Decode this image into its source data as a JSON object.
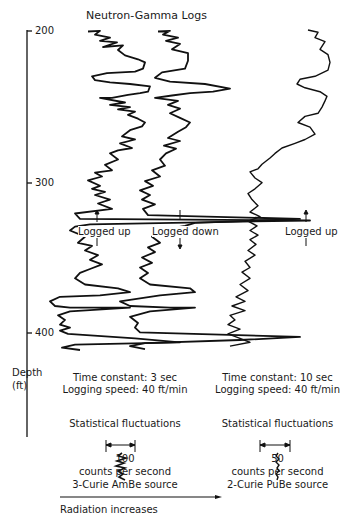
{
  "chart_data": {
    "type": "line",
    "title": "Neutron-Gamma Logs",
    "xlabel": "Radiation increases",
    "ylabel": "Depth (ft)",
    "ylim": [
      200,
      425
    ],
    "y_ticks": [
      200,
      300,
      400
    ],
    "grid": false,
    "series": [
      {
        "name": "Logged up (3 sec, AmBe)",
        "direction": "up",
        "points": [
          [
            88,
            32
          ],
          [
            100,
            31
          ],
          [
            95,
            36
          ],
          [
            110,
            40
          ],
          [
            100,
            44
          ],
          [
            117,
            46
          ],
          [
            103,
            52
          ],
          [
            123,
            50
          ],
          [
            118,
            56
          ],
          [
            125,
            63
          ],
          [
            138,
            68
          ],
          [
            145,
            72
          ],
          [
            143,
            80
          ],
          [
            135,
            84
          ],
          [
            107,
            86
          ],
          [
            92,
            90
          ],
          [
            95,
            95
          ],
          [
            110,
            98
          ],
          [
            130,
            100
          ],
          [
            150,
            103
          ],
          [
            148,
            110
          ],
          [
            140,
            112
          ],
          [
            128,
            114
          ],
          [
            112,
            118
          ],
          [
            100,
            118
          ],
          [
            125,
            124
          ],
          [
            110,
            127
          ],
          [
            130,
            130
          ],
          [
            118,
            133
          ],
          [
            135,
            136
          ],
          [
            128,
            140
          ],
          [
            138,
            145
          ],
          [
            145,
            150
          ],
          [
            142,
            155
          ],
          [
            130,
            160
          ],
          [
            122,
            168
          ],
          [
            135,
            172
          ],
          [
            120,
            177
          ],
          [
            132,
            183
          ],
          [
            118,
            186
          ],
          [
            110,
            190
          ],
          [
            118,
            198
          ],
          [
            105,
            205
          ],
          [
            112,
            212
          ],
          [
            95,
            215
          ],
          [
            102,
            220
          ],
          [
            88,
            225
          ],
          [
            100,
            232
          ],
          [
            92,
            236
          ],
          [
            105,
            240
          ],
          [
            95,
            244
          ],
          [
            110,
            250
          ],
          [
            98,
            255
          ],
          [
            112,
            262
          ],
          [
            75,
            268
          ],
          [
            80,
            275
          ],
          [
            310,
            277
          ],
          [
            90,
            282
          ],
          [
            75,
            285
          ],
          [
            70,
            290
          ],
          [
            85,
            298
          ],
          [
            78,
            306
          ],
          [
            92,
            310
          ],
          [
            85,
            316
          ],
          [
            98,
            322
          ],
          [
            90,
            328
          ],
          [
            102,
            334
          ],
          [
            90,
            340
          ],
          [
            80,
            345
          ],
          [
            75,
            352
          ],
          [
            85,
            360
          ],
          [
            118,
            365
          ],
          [
            130,
            370
          ],
          [
            100,
            374
          ],
          [
            60,
            376
          ],
          [
            50,
            382
          ],
          [
            55,
            388
          ],
          [
            70,
            390
          ],
          [
            130,
            390
          ],
          [
            70,
            395
          ],
          [
            58,
            400
          ],
          [
            65,
            406
          ],
          [
            60,
            412
          ],
          [
            70,
            416
          ],
          [
            60,
            420
          ],
          [
            68,
            424
          ],
          [
            135,
            430
          ],
          [
            180,
            435
          ],
          [
            75,
            438
          ],
          [
            62,
            442
          ],
          [
            80,
            445
          ]
        ]
      },
      {
        "name": "Logged down (3 sec, AmBe)",
        "direction": "down",
        "points": [
          [
            158,
            32
          ],
          [
            170,
            31
          ],
          [
            163,
            36
          ],
          [
            178,
            40
          ],
          [
            166,
            44
          ],
          [
            180,
            48
          ],
          [
            172,
            55
          ],
          [
            188,
            60
          ],
          [
            188,
            70
          ],
          [
            185,
            80
          ],
          [
            162,
            85
          ],
          [
            155,
            92
          ],
          [
            170,
            97
          ],
          [
            205,
            100
          ],
          [
            230,
            106
          ],
          [
            213,
            110
          ],
          [
            190,
            112
          ],
          [
            172,
            115
          ],
          [
            155,
            118
          ],
          [
            178,
            122
          ],
          [
            168,
            127
          ],
          [
            180,
            132
          ],
          [
            170,
            138
          ],
          [
            180,
            144
          ],
          [
            190,
            150
          ],
          [
            186,
            156
          ],
          [
            178,
            162
          ],
          [
            168,
            170
          ],
          [
            180,
            174
          ],
          [
            164,
            180
          ],
          [
            176,
            184
          ],
          [
            166,
            190
          ],
          [
            160,
            198
          ],
          [
            165,
            206
          ],
          [
            152,
            212
          ],
          [
            160,
            220
          ],
          [
            145,
            226
          ],
          [
            153,
            232
          ],
          [
            140,
            238
          ],
          [
            150,
            244
          ],
          [
            142,
            250
          ],
          [
            155,
            256
          ],
          [
            143,
            262
          ],
          [
            148,
            270
          ],
          [
            300,
            275
          ],
          [
            195,
            280
          ],
          [
            185,
            284
          ],
          [
            160,
            290
          ],
          [
            152,
            298
          ],
          [
            160,
            306
          ],
          [
            148,
            312
          ],
          [
            155,
            318
          ],
          [
            142,
            325
          ],
          [
            152,
            332
          ],
          [
            140,
            338
          ],
          [
            148,
            345
          ],
          [
            140,
            352
          ],
          [
            150,
            360
          ],
          [
            190,
            365
          ],
          [
            195,
            370
          ],
          [
            160,
            374
          ],
          [
            120,
            382
          ],
          [
            130,
            388
          ],
          [
            170,
            390
          ],
          [
            195,
            390
          ],
          [
            150,
            395
          ],
          [
            130,
            402
          ],
          [
            138,
            410
          ],
          [
            135,
            416
          ],
          [
            140,
            422
          ],
          [
            300,
            428
          ],
          [
            240,
            432
          ],
          [
            145,
            436
          ],
          [
            130,
            440
          ],
          [
            145,
            444
          ]
        ]
      },
      {
        "name": "Logged up (10 sec, PuBe)",
        "direction": "up",
        "points": [
          [
            308,
            30
          ],
          [
            318,
            33
          ],
          [
            315,
            40
          ],
          [
            325,
            45
          ],
          [
            320,
            55
          ],
          [
            328,
            62
          ],
          [
            330,
            72
          ],
          [
            328,
            82
          ],
          [
            315,
            90
          ],
          [
            300,
            94
          ],
          [
            297,
            100
          ],
          [
            305,
            105
          ],
          [
            320,
            110
          ],
          [
            327,
            116
          ],
          [
            325,
            122
          ],
          [
            322,
            130
          ],
          [
            318,
            138
          ],
          [
            305,
            142
          ],
          [
            298,
            150
          ],
          [
            310,
            156
          ],
          [
            315,
            165
          ],
          [
            305,
            172
          ],
          [
            295,
            177
          ],
          [
            282,
            183
          ],
          [
            275,
            190
          ],
          [
            270,
            196
          ],
          [
            262,
            204
          ],
          [
            258,
            210
          ],
          [
            250,
            214
          ],
          [
            255,
            222
          ],
          [
            262,
            228
          ],
          [
            255,
            236
          ],
          [
            248,
            242
          ],
          [
            252,
            250
          ],
          [
            258,
            258
          ],
          [
            250,
            266
          ],
          [
            260,
            272
          ],
          [
            248,
            278
          ],
          [
            257,
            284
          ],
          [
            250,
            290
          ],
          [
            258,
            296
          ],
          [
            250,
            302
          ],
          [
            256,
            308
          ],
          [
            248,
            316
          ],
          [
            255,
            322
          ],
          [
            245,
            330
          ],
          [
            250,
            338
          ],
          [
            242,
            344
          ],
          [
            250,
            352
          ],
          [
            240,
            360
          ],
          [
            248,
            368
          ],
          [
            236,
            376
          ],
          [
            245,
            382
          ],
          [
            232,
            388
          ],
          [
            245,
            394
          ],
          [
            230,
            400
          ],
          [
            235,
            406
          ],
          [
            228,
            412
          ],
          [
            240,
            418
          ],
          [
            228,
            424
          ],
          [
            240,
            430
          ],
          [
            250,
            435
          ],
          [
            230,
            440
          ]
        ]
      }
    ]
  },
  "title": "Neutron-Gamma Logs",
  "axis": {
    "ticks": [
      "200",
      "300",
      "400"
    ],
    "label_line1": "Depth",
    "label_line2": "(ft)"
  },
  "annotations": {
    "logged_up_left": "Logged up",
    "logged_down": "Logged down",
    "logged_up_right": "Logged up"
  },
  "left_panel": {
    "time_constant": "Time constant: 3 sec",
    "logging_speed": "Logging speed: 40 ft/min",
    "fluctuations": "Statistical fluctuations",
    "scale_value": "100",
    "units": "counts per second",
    "source": "3-Curie AmBe source"
  },
  "right_panel": {
    "time_constant": "Time constant: 10 sec",
    "logging_speed": "Logging speed: 40 ft/min",
    "fluctuations": "Statistical fluctuations",
    "scale_value": "50",
    "units": "counts per second",
    "source": "2-Curie PuBe source"
  },
  "footer": {
    "radiation_label": "Radiation increases"
  }
}
